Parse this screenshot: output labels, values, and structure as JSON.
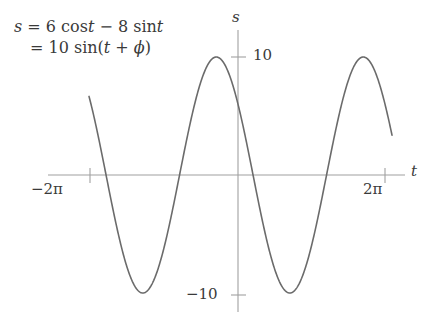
{
  "figure": {
    "equation": {
      "line1": "s = 6 cos t − 8 sin t",
      "line1_lhs": "s",
      "line1_eq": "=",
      "line1_rhs_a": "6 cos",
      "line1_rhs_var1": "t",
      "line1_minus": "−",
      "line1_rhs_b": "8 sin",
      "line1_rhs_var2": "t",
      "line2": "= 10 sin(t + ϕ)",
      "line2_eq": "=",
      "line2_amp": "10 sin(",
      "line2_var": "t",
      "line2_plus": "+",
      "line2_phase": "ϕ",
      "line2_close": ")"
    },
    "axes": {
      "y_axis_label": "s",
      "x_axis_label": "t",
      "y_tick_positive": "10",
      "y_tick_negative": "−10",
      "x_tick_left": "−2π",
      "x_tick_right": "2π"
    },
    "colors": {
      "curve": "#6b6b6b",
      "axis": "#a0a0a0",
      "text": "#3a3a3a",
      "background": "#ffffff"
    }
  },
  "chart_data": {
    "type": "line",
    "title": "",
    "subtitle": "",
    "xlabel": "t",
    "ylabel": "s",
    "equation": "s = 6 cos t - 8 sin t = 10 sin(t + phi)",
    "amplitude": 10,
    "period": 6.283185307179586,
    "phase_shift_deg": 143.13,
    "grid": false,
    "legend": null,
    "annotations": [
      "s = 6 cos t − 8 sin t",
      "= 10 sin(t + ϕ)"
    ],
    "xlim": [
      -7.85,
      7.85
    ],
    "ylim": [
      -13.0,
      13.0
    ],
    "xticks": [
      -6.283185307179586,
      6.283185307179586
    ],
    "xticklabels": [
      "−2π",
      "2π"
    ],
    "yticks": [
      10,
      -10
    ],
    "yticklabels": [
      "10",
      "−10"
    ],
    "series": [
      {
        "name": "s(t) = 6 cos t - 8 sin t",
        "color": "#6b6b6b",
        "x": [
          -6.6,
          -6.2,
          -5.8,
          -5.4,
          -5.0,
          -4.6,
          -4.2,
          -3.8,
          -3.4,
          -3.0,
          -2.6,
          -2.2,
          -1.8,
          -1.4,
          -1.0,
          -0.6,
          -0.2,
          0.2,
          0.6,
          1.0,
          1.4,
          1.8,
          2.2,
          2.6,
          3.0,
          3.4,
          3.8,
          4.2,
          4.6,
          5.0,
          5.4,
          5.8,
          6.2,
          6.6,
          7.0,
          7.35
        ],
        "y": [
          7.31,
          10.0,
          8.8,
          4.81,
          -0.97,
          -6.62,
          -9.83,
          -9.56,
          -6.04,
          -0.81,
          -5.03,
          -9.18,
          -9.98,
          -6.87,
          -1.49,
          4.47,
          7.47,
          7.47,
          4.47,
          -1.49,
          -6.87,
          -9.98,
          -9.18,
          -5.03,
          -0.81,
          4.97,
          9.08,
          10.0,
          7.26,
          2.09,
          -3.8,
          -8.3,
          -9.98,
          -7.31,
          -2.31,
          2.19
        ]
      }
    ],
    "exact_y_function": "10*sin(t + 2.4981)"
  }
}
